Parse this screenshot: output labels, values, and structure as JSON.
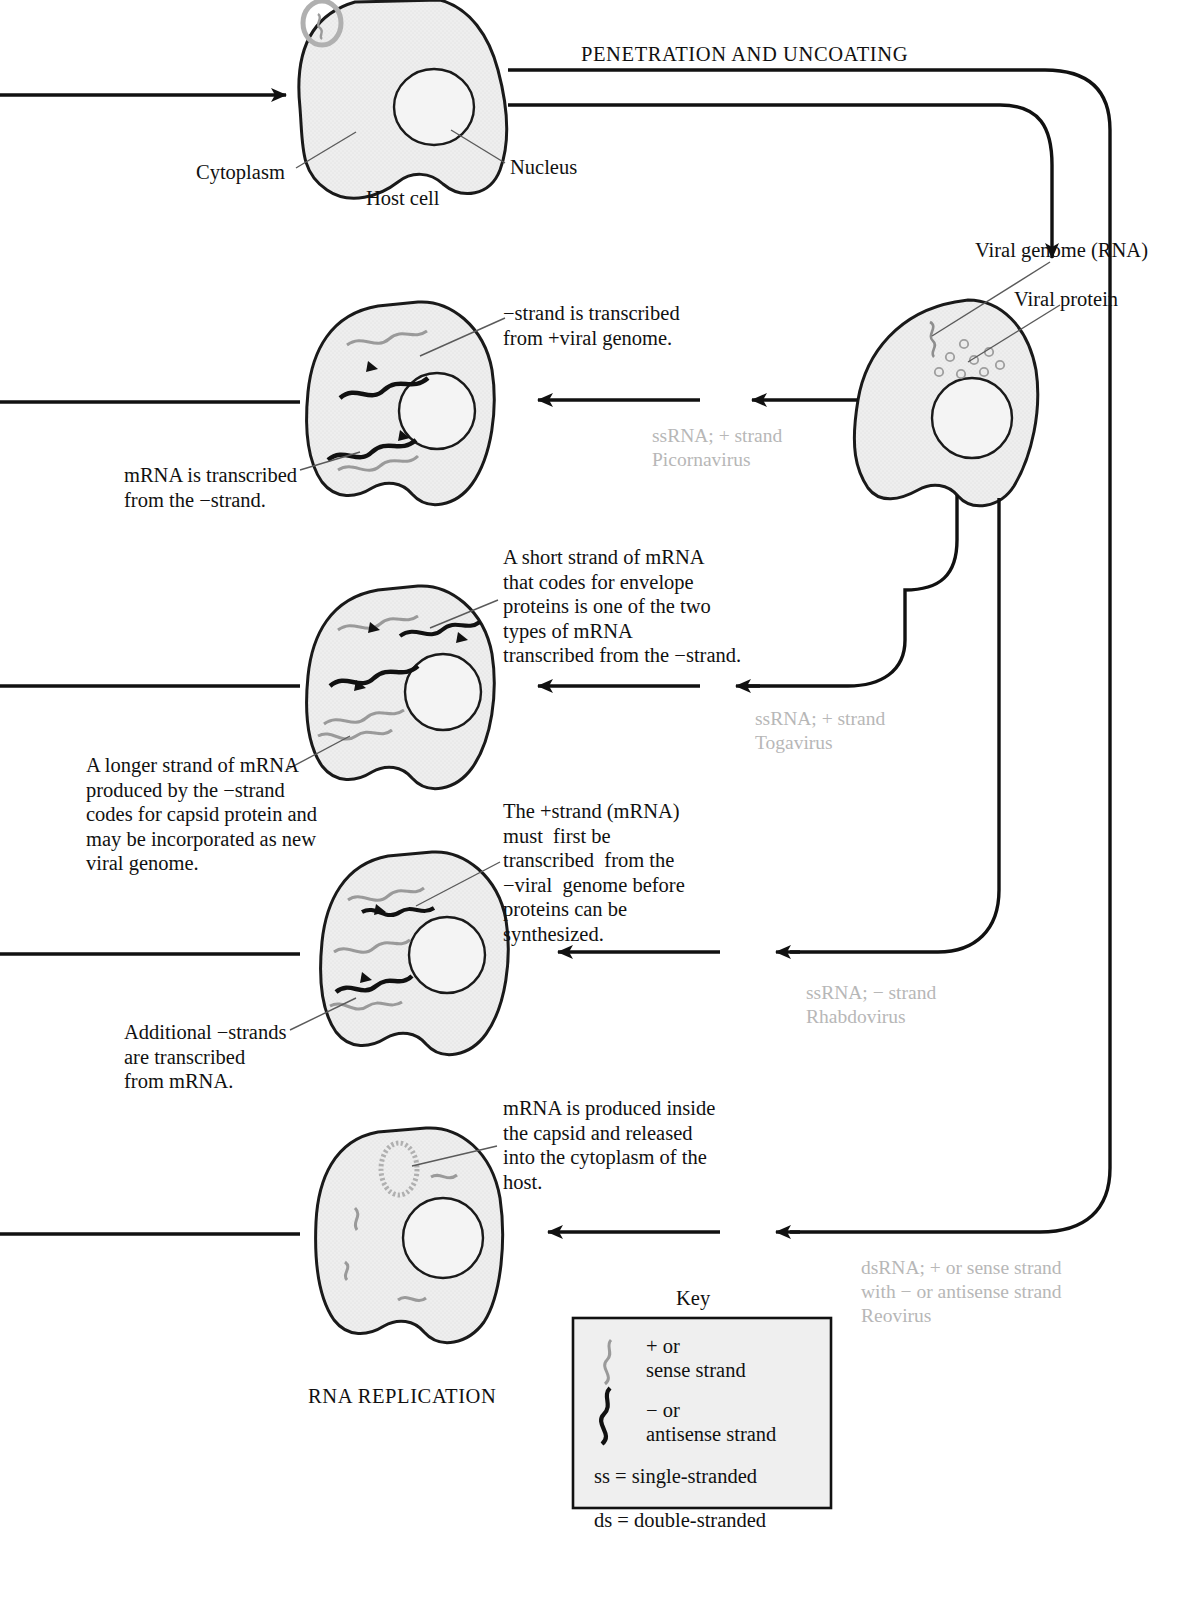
{
  "diagram": {
    "title_top": "PENETRATION AND UNCOATING",
    "title_bottom": "RNA REPLICATION"
  },
  "host_cell": {
    "cytoplasm_label": "Cytoplasm",
    "nucleus_label": "Nucleus",
    "cell_label": "Host cell"
  },
  "infected_cell": {
    "genome_label": "Viral genome (RNA)",
    "protein_label": "Viral protein"
  },
  "pathways": [
    {
      "id": "picornavirus",
      "virus_line1": "ssRNA; + strand",
      "virus_line2": "Picornavirus",
      "annotation_right": "−strand is transcribed\nfrom +viral genome.",
      "annotation_left": "mRNA is transcribed\nfrom the −strand."
    },
    {
      "id": "togavirus",
      "virus_line1": "ssRNA; + strand",
      "virus_line2": "Togavirus",
      "annotation_right": "A short strand of mRNA\nthat codes for envelope\nproteins is one of the two\ntypes of mRNA\ntranscribed from the −strand.",
      "annotation_left": "A longer strand of mRNA\nproduced by the −strand\ncodes for capsid protein and\nmay be incorporated as new\nviral genome."
    },
    {
      "id": "rhabdovirus",
      "virus_line1": "ssRNA; − strand",
      "virus_line2": "Rhabdovirus",
      "annotation_right": "The +strand (mRNA)\nmust  first be\ntranscribed  from the\n−viral  genome before\nproteins can be\nsynthesized.",
      "annotation_left": "Additional −strands\nare transcribed\nfrom mRNA."
    },
    {
      "id": "reovirus",
      "virus_line1": "dsRNA; + or sense strand",
      "virus_line2": "with − or antisense strand",
      "virus_line3": "Reovirus",
      "annotation_right": "mRNA is produced inside\nthe capsid and released\ninto the cytoplasm of the\nhost.",
      "annotation_left": ""
    }
  ],
  "key": {
    "title": "Key",
    "entries": [
      {
        "icon": "gray-wavy-strand-icon",
        "line1": "+ or",
        "line2": "sense strand"
      },
      {
        "icon": "black-wavy-strand-icon",
        "line1": "− or",
        "line2": "antisense strand"
      },
      {
        "icon": "none",
        "line1": "ss = single-stranded",
        "line2": ""
      },
      {
        "icon": "none",
        "line1": "ds = double-stranded",
        "line2": ""
      }
    ]
  },
  "colors": {
    "ink": "#111111",
    "cell_fill": "#eeeeee",
    "cell_stroke": "#1a1a1a",
    "sense_strand": "#9a9a9a",
    "antisense_strand": "#111111",
    "virus_label": "#b7b7b7",
    "key_fill": "#efefef"
  }
}
